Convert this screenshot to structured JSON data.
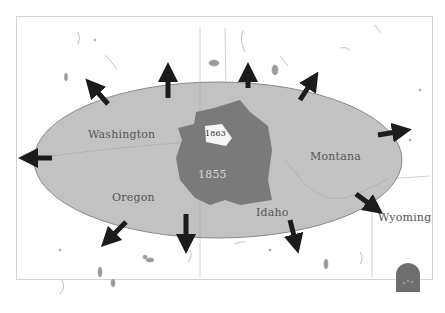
{
  "map": {
    "colors": {
      "background": "#ffffff",
      "expansion_zone": "#c2c2c2",
      "expansion_border": "#8a8a8a",
      "reservation_1855": "#7a7a7a",
      "reservation_1863": "#f6f6f6",
      "arrows": "#1c1c1c",
      "state_lines": "#bdbdbd",
      "legend_arch": "#6e6e6e"
    },
    "labels": {
      "washington": "Washington",
      "oregon": "Oregon",
      "idaho": "Idaho",
      "montana": "Montana",
      "wyoming": "Wyoming"
    },
    "years": {
      "outer_reservation": "1855",
      "inner_reservation": "1863"
    },
    "arrows": [
      {
        "direction": "west"
      },
      {
        "direction": "northwest"
      },
      {
        "direction": "north"
      },
      {
        "direction": "north"
      },
      {
        "direction": "northeast"
      },
      {
        "direction": "east"
      },
      {
        "direction": "southeast"
      },
      {
        "direction": "south"
      },
      {
        "direction": "south"
      },
      {
        "direction": "southwest"
      }
    ]
  }
}
